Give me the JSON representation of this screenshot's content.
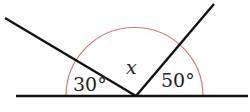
{
  "diagram": {
    "type": "angles-on-a-straight-line",
    "labels": {
      "left_angle": "30°",
      "middle_angle": "x",
      "right_angle": "50°"
    },
    "colors": {
      "lines": "#111111",
      "arcs": "#d9776e",
      "text": "#222222",
      "background": "#ffffff"
    }
  }
}
